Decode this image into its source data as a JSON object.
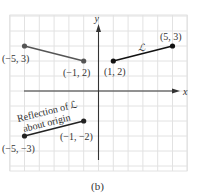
{
  "figure": {
    "caption": "(b)",
    "x_axis_label": "x",
    "y_axis_label": "y",
    "line_label": "ℒ",
    "reflection_label_line1": "Reflection of ℒ",
    "reflection_label_line2": "about origin",
    "grid_range": {
      "x": [
        -6,
        6
      ],
      "y": [
        -5,
        5
      ]
    },
    "colors": {
      "original_segment": "#111111",
      "left_segment": "#555555",
      "reflection_segment": "#222222",
      "grid": "#e2e2e2",
      "axis": "#333333"
    },
    "segments": [
      {
        "id": "L",
        "name": "line-L",
        "color_key": "original_segment",
        "points": [
          {
            "x": 1,
            "y": 2,
            "label": "(1, 2)"
          },
          {
            "x": 5,
            "y": 3,
            "label": "(5, 3)"
          }
        ]
      },
      {
        "id": "reflection-y",
        "name": "reflection-y-axis-segment",
        "color_key": "left_segment",
        "points": [
          {
            "x": -5,
            "y": 3,
            "label": "(−5, 3)"
          },
          {
            "x": -1,
            "y": 2,
            "label": "(−1, 2)"
          }
        ]
      },
      {
        "id": "reflection-origin",
        "name": "reflection-origin-segment",
        "color_key": "reflection_segment",
        "points": [
          {
            "x": -5,
            "y": -3,
            "label": "(−5, −3)"
          },
          {
            "x": -1,
            "y": -2,
            "label": "(−1, −2)"
          }
        ]
      }
    ]
  }
}
